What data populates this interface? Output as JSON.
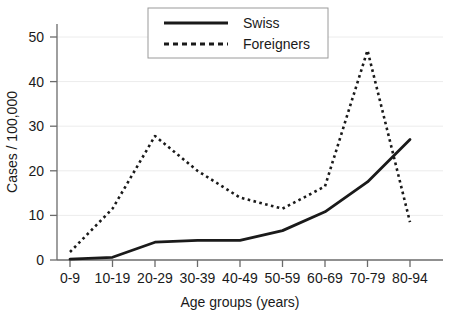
{
  "chart_data": {
    "type": "line",
    "title": "",
    "xlabel": "Age groups (years)",
    "ylabel": "Cases / 100,000",
    "categories": [
      "0-9",
      "10-19",
      "20-29",
      "30-39",
      "40-49",
      "50-59",
      "60-69",
      "70-79",
      "80-94"
    ],
    "yticks": [
      0,
      10,
      20,
      30,
      40,
      50
    ],
    "ylim": [
      0,
      53
    ],
    "grid": true,
    "legend_position": "top-center",
    "series": [
      {
        "name": "Swiss",
        "style": "solid",
        "color": "#1a1a1a",
        "values": [
          0.2,
          0.6,
          4.0,
          4.4,
          4.4,
          6.6,
          10.8,
          17.5,
          27.0
        ]
      },
      {
        "name": "Foreigners",
        "style": "dotted",
        "color": "#1a1a1a",
        "values": [
          1.8,
          11.5,
          27.8,
          20.0,
          14.0,
          11.5,
          16.5,
          47.0,
          8.5
        ]
      }
    ]
  },
  "legend": {
    "items": [
      {
        "label": "Swiss"
      },
      {
        "label": "Foreigners"
      }
    ]
  },
  "axes": {
    "y_title": "Cases / 100,000",
    "x_title": "Age groups (years)",
    "y_tick_labels": [
      "0",
      "10",
      "20",
      "30",
      "40",
      "50"
    ],
    "x_tick_labels": [
      "0-9",
      "10-19",
      "20-29",
      "30-39",
      "40-49",
      "50-59",
      "60-69",
      "70-79",
      "80-94"
    ]
  },
  "colors": {
    "ink": "#1a1a1a",
    "grid": "#e8e8e8",
    "axis": "#6b6b6b",
    "background": "#ffffff",
    "legend_border": "#9a9a9a"
  }
}
